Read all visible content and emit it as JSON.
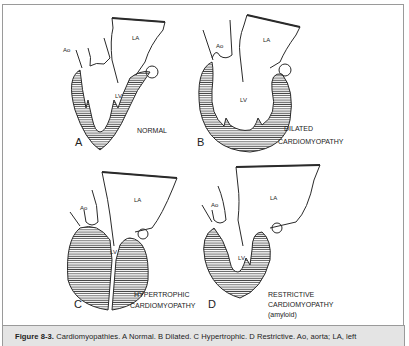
{
  "figure": {
    "caption_label": "Figure 8-3.",
    "caption_text": "Cardiomyopathies. A Normal. B Dilated. C Hypertrophic. D Restrictive. Ao, aorta; LA, left"
  },
  "panels": [
    {
      "letter": "A",
      "condition_lines": [
        "NORMAL"
      ],
      "labels": {
        "ao": "Ao",
        "la": "LA",
        "lv": "LV"
      }
    },
    {
      "letter": "B",
      "condition_lines": [
        "DILATED",
        "CARDIOMYOPATHY"
      ],
      "labels": {
        "ao": "Ao",
        "la": "LA",
        "lv": "LV"
      }
    },
    {
      "letter": "C",
      "condition_lines": [
        "HYPERTROPHIC",
        "CARDIOMYOPATHY"
      ],
      "labels": {
        "ao": "Ao",
        "la": "LA",
        "lv": "LV"
      }
    },
    {
      "letter": "D",
      "condition_lines": [
        "RESTRICTIVE",
        "CARDIOMYOPATHY",
        "(amyloid)"
      ],
      "labels": {
        "ao": "Ao",
        "la": "LA",
        "lv": "LV"
      }
    }
  ],
  "colors": {
    "line": "#2a2a2a",
    "frame": "#9a9a9a",
    "caption_bg": "#e4e4e4"
  }
}
